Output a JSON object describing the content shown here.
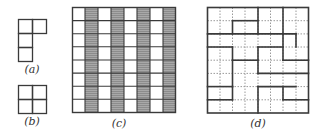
{
  "figures": {
    "a": {
      "label": "(a)",
      "description": "L-shaped tromino: 3 cells vertical with 1 extra cell at top-right",
      "cells": [
        [
          0,
          0
        ],
        [
          1,
          0
        ],
        [
          0,
          1
        ],
        [
          0,
          2
        ]
      ]
    },
    "b": {
      "label": "(b)",
      "description": "2x2 square",
      "cells": [
        [
          0,
          0
        ],
        [
          1,
          0
        ],
        [
          0,
          1
        ],
        [
          1,
          1
        ]
      ]
    },
    "c": {
      "label": "(c)",
      "description": "8x8 grid with alternating shaded columns (columns 2,4,6,8 shaded)",
      "rows": 8,
      "cols": 8,
      "shaded_columns": [
        1,
        3,
        5,
        7
      ],
      "shade_color": "#8a8a8a"
    },
    "d": {
      "label": "(d)",
      "description": "8x8 grid with dotted cell lines and bold tiling boundaries",
      "rows": 8,
      "cols": 8
    }
  },
  "colors": {
    "line": "#3a3a3a",
    "dotted": "#9a9a9a",
    "shade": "#8c8c8c",
    "background": "#ffffff"
  }
}
